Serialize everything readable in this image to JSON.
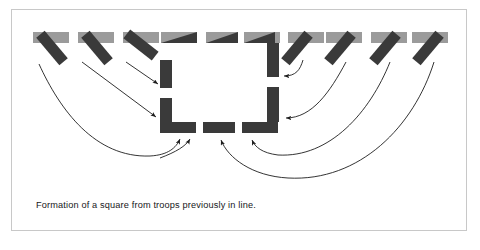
{
  "figure": {
    "caption": "Formation of a square from troops previously in line.",
    "colors": {
      "page_background": "#ffffff",
      "frame_border": "#c8c8c8",
      "frame_background": "#ffffff",
      "line_unit_gray": "#9b9b9b",
      "square_unit_dark": "#3a3a3a",
      "arrow_stroke": "#1d1d1d",
      "caption_text": "#17171a"
    },
    "line_formation": {
      "label": "original line of troops",
      "unit_count": 10,
      "unit_width": 34,
      "unit_height": 11,
      "top": 32,
      "lefts": [
        33,
        78,
        123,
        168,
        213,
        258,
        303,
        348,
        393,
        417
      ]
    },
    "marching_units": {
      "label": "troops marching out of line",
      "count": 8,
      "rotations_deg": [
        50,
        50,
        40,
        0,
        0,
        0,
        -50,
        -50,
        -50,
        -50
      ]
    },
    "square_formation": {
      "label": "square being formed",
      "sides": [
        "left",
        "right",
        "bottom"
      ],
      "segment_count": 8
    },
    "arrows": {
      "label": "movement paths",
      "count": 8,
      "style": "thin curved line with solid arrowhead"
    }
  }
}
